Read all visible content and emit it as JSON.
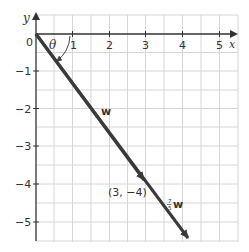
{
  "axes": {
    "x_label": "x",
    "y_label": "y",
    "origin_label": "0",
    "x_ticks": [
      "1",
      "2",
      "3",
      "4",
      "5"
    ],
    "y_ticks": [
      "−1",
      "−2",
      "−3",
      "−4",
      "−5"
    ]
  },
  "labels": {
    "angle": "θ",
    "vector_w": "w",
    "point": "(3, −4)",
    "scaled_coef_num": "7",
    "scaled_coef_den": "5",
    "scaled_vector": "w"
  },
  "colors": {
    "grid": "#d6d6d6",
    "axis": "#333333",
    "vector": "#3a3a3a",
    "text": "#333333"
  }
}
